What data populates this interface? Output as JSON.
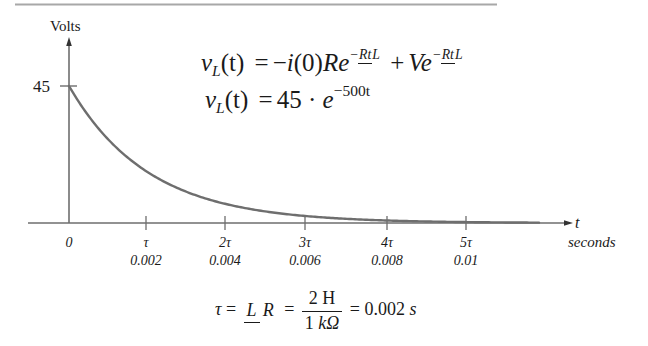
{
  "chart_data": {
    "type": "line",
    "title": "",
    "ylabel": "Volts",
    "xlabel": "t",
    "xunit_label": "seconds",
    "y_tick": {
      "value": 45,
      "label": "45"
    },
    "x_ticks": [
      {
        "symbol": "0",
        "value_label": "",
        "t": 0
      },
      {
        "symbol": "τ",
        "value_label": "0.002",
        "t": 0.002
      },
      {
        "symbol": "2τ",
        "value_label": "0.004",
        "t": 0.004
      },
      {
        "symbol": "3τ",
        "value_label": "0.006",
        "t": 0.006
      },
      {
        "symbol": "4τ",
        "value_label": "0.008",
        "t": 0.008
      },
      {
        "symbol": "5τ",
        "value_label": "0.01",
        "t": 0.01
      }
    ],
    "series": [
      {
        "name": "v_L(t)",
        "function": "45 * exp(-500 t)",
        "x": [
          0,
          0.001,
          0.002,
          0.003,
          0.004,
          0.005,
          0.006,
          0.007,
          0.008,
          0.009,
          0.01,
          0.012,
          0.014
        ],
        "values": [
          45,
          27.29,
          16.55,
          10.04,
          6.09,
          3.69,
          2.24,
          1.36,
          0.82,
          0.5,
          0.3,
          0.11,
          0.04
        ]
      }
    ],
    "xlim": [
      0,
      0.0135
    ],
    "ylim": [
      0,
      50
    ],
    "grid": false,
    "legend": "none",
    "annotations": [
      "v_L(t) = -i(0) R e^{-Rt/L} + V e^{-Rt/L}",
      "v_L(t) = 45 · e^{-500t}",
      "τ = L/R = 2 H / 1 kΩ = 0.002 s"
    ]
  },
  "labels": {
    "y_axis": "Volts",
    "y_tick": "45",
    "x_axis_var": "t",
    "x_axis_unit": "seconds"
  },
  "equations": {
    "line1": {
      "lhs_v": "v",
      "lhs_sub": "L",
      "lhs_arg": "(t)",
      "eq": "=",
      "minus": "−",
      "i_term": "i",
      "i_arg": "(0)",
      "R": "R",
      "e": "e",
      "exp_sign": "−",
      "exp_num": "Rt",
      "exp_den": "L",
      "plus": "+",
      "V": "V"
    },
    "line2": {
      "lhs_v": "v",
      "lhs_sub": "L",
      "lhs_arg": "(t)",
      "eq": "=",
      "coef": "45 ·",
      "e": "e",
      "exponent": "−500t"
    },
    "tau": {
      "tau": "τ",
      "eq1": "=",
      "frac1_num": "L",
      "frac1_den": "R",
      "eq2": "=",
      "frac2_num": "2 H",
      "frac2_den_num": "1 ",
      "frac2_den_unit": "kΩ",
      "eq3": "= 0.002",
      "unit": "s"
    }
  },
  "colors": {
    "axis": "#6e6e6e",
    "curve": "#6e6e6e",
    "top_rule": "#a8a8a8",
    "text": "#1a1a1a"
  }
}
